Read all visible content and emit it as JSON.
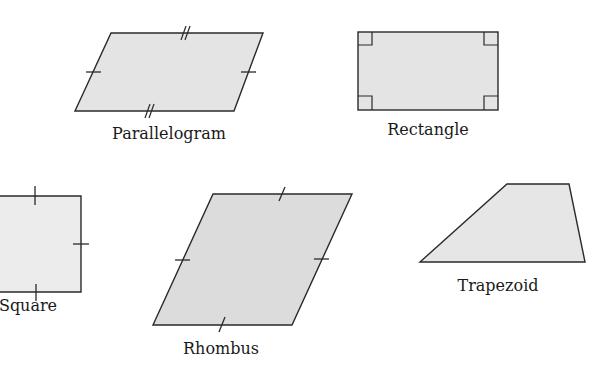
{
  "figure": {
    "fill_color": "#e4e4e4",
    "stroke_color": "#2a2a2a",
    "shapes": [
      {
        "name": "Parallelogram",
        "label": "Parallelogram",
        "vertices": [
          [
            111,
            33
          ],
          [
            263,
            33
          ],
          [
            234,
            111
          ],
          [
            75,
            111
          ]
        ],
        "markings": "opposite sides equal: single tick on left/right sides, double tick on top/bottom sides"
      },
      {
        "name": "Rectangle",
        "label": "Rectangle",
        "vertices": [
          [
            358,
            32
          ],
          [
            498,
            32
          ],
          [
            498,
            110
          ],
          [
            358,
            110
          ]
        ],
        "markings": "right-angle squares at all four corners"
      },
      {
        "name": "Square",
        "label": "Square",
        "vertices": [
          [
            -5,
            196
          ],
          [
            81,
            196
          ],
          [
            81,
            292
          ],
          [
            -5,
            292
          ]
        ],
        "markings": "single tick on each visible side (all sides equal)"
      },
      {
        "name": "Rhombus",
        "label": "Rhombus",
        "vertices": [
          [
            213,
            194
          ],
          [
            352,
            194
          ],
          [
            292,
            325
          ],
          [
            153,
            325
          ]
        ],
        "markings": "single tick on each side (all sides equal)"
      },
      {
        "name": "Trapezoid",
        "label": "Trapezoid",
        "vertices": [
          [
            420,
            262
          ],
          [
            507,
            184
          ],
          [
            569,
            184
          ],
          [
            585,
            262
          ]
        ],
        "markings": "none"
      }
    ]
  }
}
